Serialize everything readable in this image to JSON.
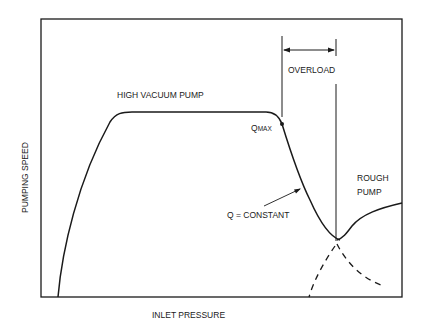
{
  "diagram": {
    "title": "",
    "x_axis_label": "INLET PRESSURE",
    "y_axis_label": "PUMPING SPEED",
    "labels": {
      "high_vacuum_pump": "HIGH VACUUM PUMP",
      "q_max_main": "Q",
      "q_max_sub": "MAX",
      "overload": "OVERLOAD",
      "q_constant": "Q = CONSTANT",
      "rough_pump_line1": "ROUGH",
      "rough_pump_line2": "PUMP"
    },
    "colors": {
      "line": "#1a1a1a",
      "background": "#ffffff"
    }
  }
}
